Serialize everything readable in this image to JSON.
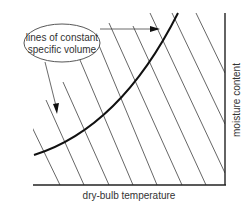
{
  "diagram": {
    "callout_label": "lines of constant specific volume",
    "callout_line1": "lines of constant",
    "callout_line2": "specific volume",
    "x_axis_label": "dry-bulb temperature",
    "y_axis_label": "moisture content",
    "colors": {
      "lines": "#555555",
      "curve": "#111111",
      "axes": "#222222",
      "text": "#333333"
    },
    "constant_volume_line_count": 9
  }
}
